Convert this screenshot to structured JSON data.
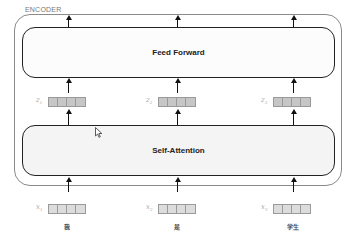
{
  "encoder": {
    "label": "ENCODER",
    "layers": {
      "feed_forward": "Feed Forward",
      "self_attention": "Self-Attention"
    }
  },
  "columns": [
    {
      "z_label": "z",
      "z_sub": "1",
      "x_label": "x",
      "x_sub": "1",
      "word": "我"
    },
    {
      "z_label": "z",
      "z_sub": "2",
      "x_label": "x",
      "x_sub": "2",
      "word": "是"
    },
    {
      "z_label": "z",
      "z_sub": "3",
      "x_label": "x",
      "x_sub": "3",
      "word": "学生"
    }
  ],
  "colors": {
    "layer_border": "#222222",
    "encoder_border": "#8a8a8a",
    "z_vector_fill": "#c6c6c6",
    "x_vector_fill": "#dcdcdc"
  }
}
